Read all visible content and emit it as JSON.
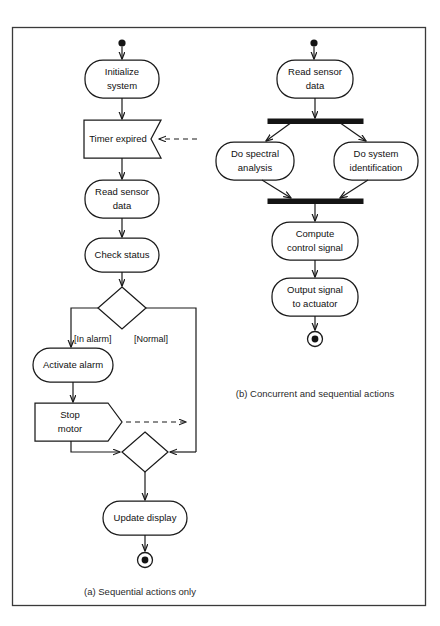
{
  "figure": {
    "background_color": "#ffffff",
    "line_color": "#1a1a1a",
    "frame_color": "#3a3a3a"
  },
  "diagram_a": {
    "caption": "(a) Sequential actions only",
    "initial_state": "initial-state-dot",
    "final_state": "final-state-bullseye",
    "nodes": [
      {
        "id": "initialize_system",
        "label_line1": "Initialize",
        "label_line2": "system",
        "shape": "activity"
      },
      {
        "id": "timer_expired",
        "label_line1": "Timer expired",
        "label_line2": "",
        "shape": "signal-receipt"
      },
      {
        "id": "read_sensor_data",
        "label_line1": "Read sensor",
        "label_line2": "data",
        "shape": "activity"
      },
      {
        "id": "check_status",
        "label_line1": "Check status",
        "label_line2": "",
        "shape": "activity"
      },
      {
        "id": "activate_alarm",
        "label_line1": "Activate alarm",
        "label_line2": "",
        "shape": "activity"
      },
      {
        "id": "stop_motor",
        "label_line1": "Stop",
        "label_line2": "motor",
        "shape": "signal-send"
      },
      {
        "id": "update_display",
        "label_line1": "Update display",
        "label_line2": "",
        "shape": "activity"
      }
    ],
    "decision": {
      "id": "status_decision",
      "shape": "diamond"
    },
    "merge": {
      "id": "status_merge",
      "shape": "diamond"
    },
    "guards": [
      {
        "id": "guard_in_alarm",
        "label": "[In alarm]"
      },
      {
        "id": "guard_normal",
        "label": "[Normal]"
      }
    ]
  },
  "diagram_b": {
    "caption": "(b) Concurrent and sequential actions",
    "initial_state": "initial-state-dot",
    "final_state": "final-state-bullseye",
    "nodes": [
      {
        "id": "read_sensor_data_b",
        "label_line1": "Read sensor",
        "label_line2": "data",
        "shape": "activity"
      },
      {
        "id": "do_spectral_analysis",
        "label_line1": "Do spectral",
        "label_line2": "analysis",
        "shape": "activity"
      },
      {
        "id": "do_system_identification",
        "label_line1": "Do system",
        "label_line2": "identification",
        "shape": "activity"
      },
      {
        "id": "compute_control_signal",
        "label_line1": "Compute",
        "label_line2": "control signal",
        "shape": "activity"
      },
      {
        "id": "output_signal_to_actuator",
        "label_line1": "Output signal",
        "label_line2": "to actuator",
        "shape": "activity"
      }
    ],
    "fork_bar": {
      "id": "fork_bar",
      "shape": "synchronization-bar"
    },
    "join_bar": {
      "id": "join_bar",
      "shape": "synchronization-bar"
    }
  }
}
